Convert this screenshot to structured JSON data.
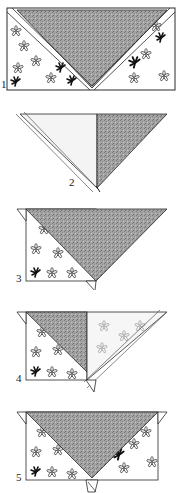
{
  "steps": [
    {
      "number": "1",
      "description": "Square of patterned fabric with shaded triangle folded down, diagonal folds on both sides"
    },
    {
      "number": "2",
      "description": "Triangle with left half light (patterned back) and right half shaded"
    },
    {
      "number": "3",
      "description": "Left corner folded; shaded triangle over patterned rectangle"
    },
    {
      "number": "4",
      "description": "Right half folded across showing patterned back"
    },
    {
      "number": "5",
      "description": "Shaded inverted triangle centered on patterned rectangle with tabs"
    }
  ],
  "colors": {
    "shade": "#9a9a9a",
    "shade_dark": "#7d7d7d",
    "line": "#2a2a2a",
    "pattern_light": "#bdbdbd",
    "pattern_dark": "#222222",
    "background": "#ffffff"
  }
}
